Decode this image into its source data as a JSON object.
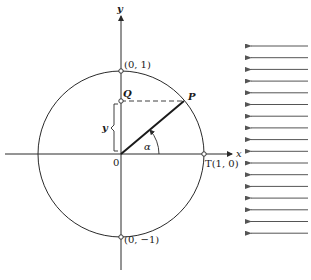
{
  "diagram": {
    "type": "unit-circle",
    "axes": {
      "x_label": "x",
      "y_label": "y",
      "origin_label": "0"
    },
    "points": {
      "top": "(0, 1)",
      "bottom": "(0, −1)",
      "right_T": "T(1, 0)",
      "Q": "Q",
      "P": "P"
    },
    "annotations": {
      "angle": "α",
      "brace_label": "y"
    },
    "incoming_arrows": {
      "count": 17,
      "direction": "left",
      "y_positions": [
        46,
        57.7,
        69.4,
        81.1,
        92.8,
        104.5,
        116.2,
        127.9,
        139.6,
        151.3,
        163,
        174.7,
        186.4,
        198.1,
        209.8,
        221.5,
        233.2
      ]
    },
    "colors": {
      "stroke": "#2a2a2a",
      "arrow": "#555555"
    }
  }
}
